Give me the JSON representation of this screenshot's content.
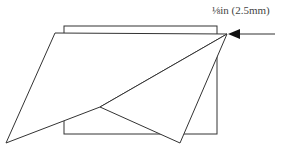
{
  "diagram": {
    "type": "folded-sheet-illustration",
    "label": "⅛in (2.5mm)",
    "colors": {
      "stroke": "#333333",
      "background": "#ffffff",
      "text": "#444444"
    },
    "shapes": {
      "rectangle": {
        "x": 64,
        "y": 26,
        "width": 153,
        "height": 108
      },
      "sheet_outline": [
        [
          55,
          33
        ],
        [
          227,
          34
        ],
        [
          100,
          107
        ],
        [
          6,
          143
        ]
      ],
      "fold_flap": [
        [
          100,
          107
        ],
        [
          180,
          143
        ],
        [
          227,
          34
        ]
      ],
      "arrow": {
        "from": [
          275,
          34
        ],
        "to": [
          228,
          34
        ]
      }
    }
  }
}
